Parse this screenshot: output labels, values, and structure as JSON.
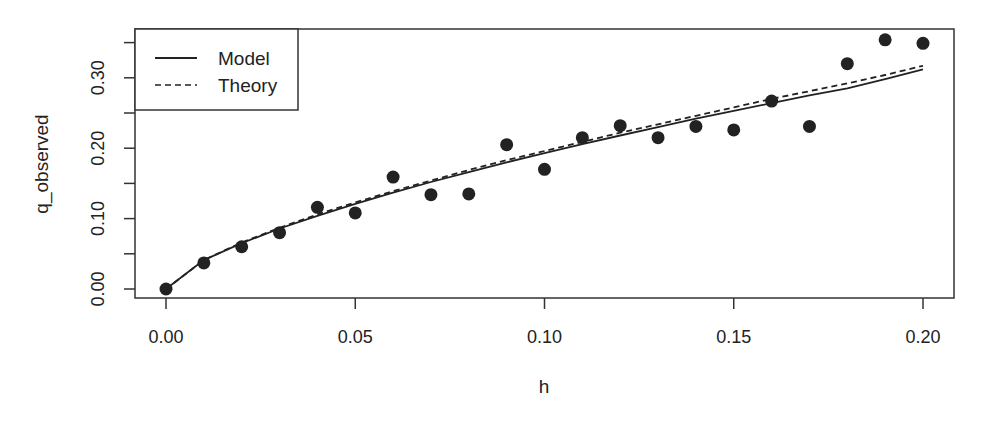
{
  "chart_data": {
    "type": "scatter",
    "title": "",
    "xlabel": "h",
    "ylabel": "q_observed",
    "xlim": [
      0.0,
      0.2
    ],
    "ylim": [
      0.0,
      0.35
    ],
    "xticks": [
      "0.00",
      "0.05",
      "0.10",
      "0.15",
      "0.20"
    ],
    "yticks": [
      "0.00",
      "0.10",
      "0.20",
      "0.30"
    ],
    "grid": false,
    "legend_position": "top-left",
    "series": [
      {
        "name": "Observed",
        "kind": "points",
        "x": [
          0.0,
          0.01,
          0.02,
          0.03,
          0.04,
          0.05,
          0.06,
          0.07,
          0.08,
          0.09,
          0.1,
          0.11,
          0.12,
          0.13,
          0.14,
          0.15,
          0.16,
          0.17,
          0.18,
          0.19,
          0.2
        ],
        "y": [
          0.0,
          0.037,
          0.06,
          0.08,
          0.116,
          0.108,
          0.159,
          0.134,
          0.135,
          0.205,
          0.17,
          0.215,
          0.232,
          0.215,
          0.231,
          0.226,
          0.267,
          0.231,
          0.32,
          0.354,
          0.349
        ]
      },
      {
        "name": "Model",
        "kind": "line",
        "style": "solid",
        "x": [
          0.0,
          0.01,
          0.02,
          0.03,
          0.04,
          0.05,
          0.06,
          0.07,
          0.08,
          0.09,
          0.1,
          0.11,
          0.12,
          0.13,
          0.14,
          0.15,
          0.16,
          0.17,
          0.18,
          0.19,
          0.2
        ],
        "y": [
          0.0,
          0.041,
          0.065,
          0.086,
          0.104,
          0.121,
          0.137,
          0.152,
          0.166,
          0.18,
          0.193,
          0.206,
          0.218,
          0.23,
          0.242,
          0.253,
          0.264,
          0.275,
          0.285,
          0.298,
          0.312
        ]
      },
      {
        "name": "Theory",
        "kind": "line",
        "style": "dashed",
        "x": [
          0.0,
          0.01,
          0.02,
          0.03,
          0.04,
          0.05,
          0.06,
          0.07,
          0.08,
          0.09,
          0.1,
          0.11,
          0.12,
          0.13,
          0.14,
          0.15,
          0.16,
          0.17,
          0.18,
          0.19,
          0.2
        ],
        "y": [
          0.0,
          0.041,
          0.066,
          0.087,
          0.106,
          0.123,
          0.139,
          0.154,
          0.169,
          0.183,
          0.196,
          0.209,
          0.222,
          0.234,
          0.246,
          0.258,
          0.27,
          0.281,
          0.292,
          0.304,
          0.317
        ]
      }
    ]
  },
  "legend": {
    "items": [
      {
        "label": "Model",
        "style": "solid"
      },
      {
        "label": "Theory",
        "style": "dashed"
      }
    ]
  },
  "colors": {
    "ink": "#222222",
    "background": "#ffffff"
  }
}
